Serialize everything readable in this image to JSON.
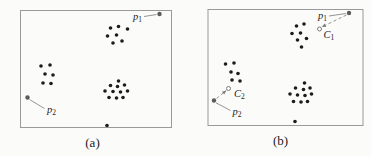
{
  "figure": {
    "type": "clustering-illustration",
    "background": "#fbfbfa",
    "colors": {
      "cluster_dot": "#1c1c1c",
      "query_dot": "#5a5a5a",
      "leader_line": "#7a7a7a",
      "dashed_line": "#7a7a7a",
      "center_marker_stroke": "#6f6f6f",
      "box_border": "#9a9a9a",
      "label_text": "#1c1c1c"
    },
    "dot_radius": 1.8,
    "panels": [
      {
        "id": "a",
        "caption": "(a)",
        "box": [
          20.5,
          10.5,
          151,
          117
        ],
        "clusters": [
          {
            "name": "top-right-cluster",
            "dots": [
              [
                110.5,
                28
              ],
              [
                118.5,
                26.5
              ],
              [
                127.5,
                29
              ],
              [
                107.5,
                36
              ],
              [
                116.5,
                35
              ],
              [
                113,
                43
              ],
              [
                122,
                41
              ]
            ]
          },
          {
            "name": "left-cluster",
            "dots": [
              [
                41,
                66
              ],
              [
                50,
                65
              ],
              [
                45,
                74
              ],
              [
                53,
                75
              ],
              [
                43,
                83
              ],
              [
                51,
                83.5
              ]
            ]
          },
          {
            "name": "bottom-right-cluster",
            "dots": [
              [
                118.5,
                81
              ],
              [
                110.5,
                85.5
              ],
              [
                117.5,
                86.5
              ],
              [
                124.5,
                85
              ],
              [
                105,
                91
              ],
              [
                113,
                91.5
              ],
              [
                120.5,
                92
              ],
              [
                127.5,
                91
              ],
              [
                109,
                97.5
              ],
              [
                116.5,
                98
              ],
              [
                123,
                97.5
              ]
            ]
          }
        ],
        "outlier_dots": [
          [
            107,
            125.5
          ]
        ],
        "query_points": [
          {
            "name": "p1",
            "label": {
              "base": "p",
              "sub": "1"
            },
            "dot": [
              159.5,
              14
            ],
            "label_pos": [
              142,
              19.5
            ],
            "label_anchor": "end",
            "leader": [
              [
                144,
                16.5
              ],
              [
                156.5,
                14.5
              ]
            ]
          },
          {
            "name": "p2",
            "label": {
              "base": "p",
              "sub": "2"
            },
            "dot": [
              27.5,
              97.5
            ],
            "label_pos": [
              47,
              113
            ],
            "label_anchor": "start",
            "leader": [
              [
                29.5,
                99.5
              ],
              [
                44.5,
                108.5
              ]
            ]
          }
        ],
        "centers": []
      },
      {
        "id": "b",
        "caption": "(b)",
        "box": [
          208,
          9.5,
          155,
          116
        ],
        "clusters": [
          {
            "name": "top-right-cluster",
            "dots": [
              [
                296.5,
                26
              ],
              [
                304,
                24
              ],
              [
                292,
                33.5
              ],
              [
                300.5,
                33
              ],
              [
                297.5,
                40
              ],
              [
                306.5,
                38.5
              ],
              [
                301.5,
                47
              ]
            ]
          },
          {
            "name": "left-cluster",
            "dots": [
              [
                225.5,
                64
              ],
              [
                234,
                63
              ],
              [
                231,
                72
              ],
              [
                238,
                73.5
              ],
              [
                232,
                80
              ],
              [
                240,
                81
              ]
            ]
          },
          {
            "name": "bottom-right-cluster",
            "dots": [
              [
                304.5,
                83
              ],
              [
                295.5,
                88
              ],
              [
                303.5,
                89.5
              ],
              [
                310,
                88
              ],
              [
                290,
                94
              ],
              [
                297.5,
                95
              ],
              [
                305,
                95.5
              ],
              [
                311.5,
                94
              ],
              [
                293.5,
                101.5
              ],
              [
                301,
                102
              ],
              [
                307.5,
                101.5
              ]
            ]
          }
        ],
        "outlier_dots": [
          [
            295,
            121.5
          ]
        ],
        "query_points": [
          {
            "name": "p1",
            "label": {
              "base": "p",
              "sub": "1"
            },
            "dot": [
              349,
              13
            ],
            "label_pos": [
              327,
              18.5
            ],
            "label_anchor": "end",
            "leader": [
              [
                329,
                16
              ],
              [
                346,
                13.5
              ]
            ],
            "dashed_arrow": {
              "from": [
                346.5,
                15
              ],
              "to": [
                321.8,
                27
              ]
            }
          },
          {
            "name": "p2",
            "label": {
              "base": "p",
              "sub": "2"
            },
            "dot": [
              214,
              100.5
            ],
            "label_pos": [
              232.5,
              115
            ],
            "label_anchor": "start",
            "leader": [
              [
                216,
                102.8
              ],
              [
                230.5,
                110.5
              ]
            ],
            "dashed_arrow": {
              "from": [
                216.5,
                98.5
              ],
              "to": [
                226.3,
                90.5
              ]
            }
          }
        ],
        "centers": [
          {
            "name": "C1",
            "label": {
              "base": "C",
              "sub": "1"
            },
            "marker": [
              319.5,
              29
            ],
            "label_pos": [
              323.5,
              37.5
            ],
            "label_anchor": "start"
          },
          {
            "name": "C2",
            "label": {
              "base": "C",
              "sub": "2"
            },
            "marker": [
              228.5,
              88.5
            ],
            "label_pos": [
              234,
              96.5
            ],
            "label_anchor": "start"
          }
        ]
      }
    ]
  }
}
